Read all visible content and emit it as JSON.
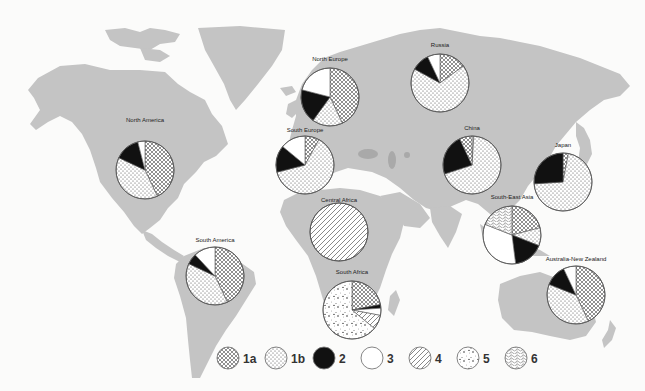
{
  "chart_data": {
    "type": "pie",
    "title": "",
    "layout": "world map with regional pie charts",
    "legend_position": "bottom",
    "legend": [
      {
        "key": "1a",
        "label": "1a",
        "pattern": "crosshatch"
      },
      {
        "key": "1b",
        "label": "1b",
        "pattern": "dots"
      },
      {
        "key": "2",
        "label": "2",
        "pattern": "solid-black"
      },
      {
        "key": "3",
        "label": "3",
        "pattern": "white"
      },
      {
        "key": "4",
        "label": "4",
        "pattern": "diagonal-lines"
      },
      {
        "key": "5",
        "label": "5",
        "pattern": "speckled"
      },
      {
        "key": "6",
        "label": "6",
        "pattern": "wavy-texture"
      }
    ],
    "pies": [
      {
        "region": "North America",
        "cx": 145,
        "cy": 170,
        "r": 29,
        "label_y": 122,
        "slices": [
          {
            "key": "1a",
            "value": 43
          },
          {
            "key": "1b",
            "value": 39
          },
          {
            "key": "2",
            "value": 14
          },
          {
            "key": "3",
            "value": 4
          }
        ]
      },
      {
        "region": "North Europe",
        "cx": 330,
        "cy": 97,
        "r": 29,
        "label_y": 61,
        "slices": [
          {
            "key": "1a",
            "value": 43
          },
          {
            "key": "1b",
            "value": 17
          },
          {
            "key": "2",
            "value": 19
          },
          {
            "key": "3",
            "value": 21
          }
        ]
      },
      {
        "region": "South Europe",
        "cx": 305,
        "cy": 165,
        "r": 29,
        "label_y": 132,
        "slices": [
          {
            "key": "1a",
            "value": 8
          },
          {
            "key": "1b",
            "value": 63
          },
          {
            "key": "2",
            "value": 15
          },
          {
            "key": "3",
            "value": 14
          }
        ]
      },
      {
        "region": "Russia",
        "cx": 440,
        "cy": 83,
        "r": 29,
        "label_y": 47,
        "slices": [
          {
            "key": "1a",
            "value": 15
          },
          {
            "key": "1b",
            "value": 68
          },
          {
            "key": "2",
            "value": 10
          },
          {
            "key": "3",
            "value": 7
          }
        ]
      },
      {
        "region": "China",
        "cx": 472,
        "cy": 165,
        "r": 29,
        "label_y": 130,
        "slices": [
          {
            "key": "3",
            "value": 1
          },
          {
            "key": "1b",
            "value": 69
          },
          {
            "key": "2",
            "value": 23
          },
          {
            "key": "1a",
            "value": 7
          }
        ]
      },
      {
        "region": "Japan",
        "cx": 563,
        "cy": 182,
        "r": 29,
        "label_y": 147,
        "slices": [
          {
            "key": "1a",
            "value": 3
          },
          {
            "key": "1b",
            "value": 71
          },
          {
            "key": "2",
            "value": 26
          }
        ]
      },
      {
        "region": "Central Africa",
        "cx": 339,
        "cy": 232,
        "r": 29,
        "label_y": 202,
        "slices": [
          {
            "key": "4",
            "value": 100
          }
        ]
      },
      {
        "region": "South Africa",
        "cx": 352,
        "cy": 310,
        "r": 29,
        "label_y": 274,
        "slices": [
          {
            "key": "1a",
            "value": 22
          },
          {
            "key": "2",
            "value": 2
          },
          {
            "key": "3",
            "value": 4
          },
          {
            "key": "4",
            "value": 8
          },
          {
            "key": "5",
            "value": 64
          }
        ]
      },
      {
        "region": "South-East Asia",
        "cx": 512,
        "cy": 235,
        "r": 29,
        "label_y": 199,
        "slices": [
          {
            "key": "1a",
            "value": 21
          },
          {
            "key": "1b",
            "value": 10
          },
          {
            "key": "2",
            "value": 17
          },
          {
            "key": "3",
            "value": 33
          },
          {
            "key": "6",
            "value": 19
          }
        ]
      },
      {
        "region": "South America",
        "cx": 215,
        "cy": 276,
        "r": 29,
        "label_y": 242,
        "slices": [
          {
            "key": "1a",
            "value": 43
          },
          {
            "key": "1b",
            "value": 39
          },
          {
            "key": "2",
            "value": 6
          },
          {
            "key": "3",
            "value": 12
          }
        ]
      },
      {
        "region": "Australia-New Zealand",
        "cx": 576,
        "cy": 295,
        "r": 29,
        "label_y": 261,
        "slices": [
          {
            "key": "1a",
            "value": 43
          },
          {
            "key": "1b",
            "value": 38
          },
          {
            "key": "2",
            "value": 12
          },
          {
            "key": "3",
            "value": 7
          }
        ]
      }
    ]
  },
  "colors": {
    "background": "#fbfbfa",
    "land": "#c4c4c4",
    "water_inland": "#a9a9a9",
    "outline": "#555555",
    "solid": "#111111"
  }
}
